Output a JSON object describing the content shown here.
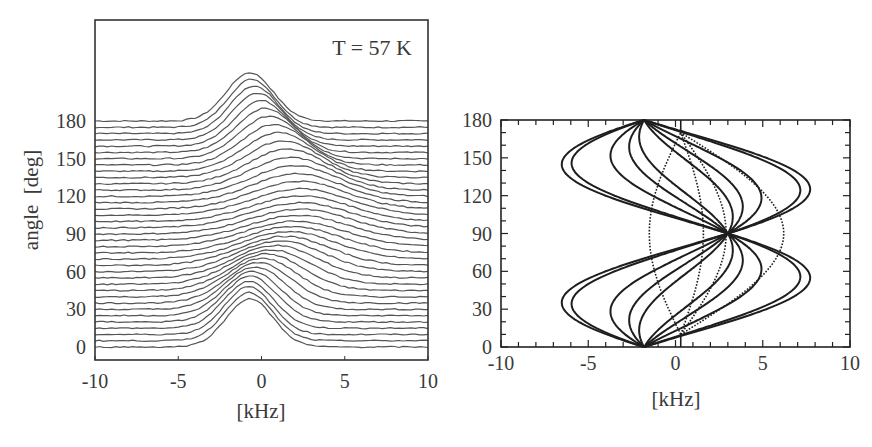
{
  "chart_data": [
    {
      "id": "left",
      "type": "line",
      "subtype": "waterfall",
      "annotation": "T = 57 K",
      "xlabel": "[kHz]",
      "ylabel": "angle  [deg]",
      "xlim": [
        -10,
        10
      ],
      "xticks": [
        -10,
        -5,
        0,
        5,
        10
      ],
      "yticks": [
        0,
        30,
        60,
        90,
        120,
        150,
        180
      ],
      "angle_step_deg": 5,
      "angles": [
        0,
        5,
        10,
        15,
        20,
        25,
        30,
        35,
        40,
        45,
        50,
        55,
        60,
        65,
        70,
        75,
        80,
        85,
        90,
        95,
        100,
        105,
        110,
        115,
        120,
        125,
        130,
        135,
        140,
        145,
        150,
        155,
        160,
        165,
        170,
        175,
        180
      ],
      "peak_model": {
        "center_khz": "0.8 - 1.5*cos(2θ) - 0.5*sin(2θ)",
        "width_sigma_khz": "1.4 + 1.6*sin²θ",
        "height_deg_units": "36 + 34*cos²θ"
      },
      "line_color": "#555555",
      "grid": false
    },
    {
      "id": "right",
      "type": "line",
      "subtype": "angular-dependence",
      "xlabel": "[kHz]",
      "ylabel": "",
      "xlim": [
        -10,
        10
      ],
      "ylim": [
        0,
        180
      ],
      "xticks": [
        -10,
        -5,
        0,
        5,
        10
      ],
      "yticks": [
        0,
        30,
        60,
        90,
        120,
        150,
        180
      ],
      "solid_model": "ν(θ) = 0.6 - 2.4*cos(2θ) + C*sin(2θ)",
      "solid_C": [
        6.7,
        6.1,
        -6.7,
        -6.1,
        3.6,
        -3.6,
        2.2,
        -2.2,
        1.2,
        -1.2
      ],
      "dotted_model": "ν(θ) = 0.3 + D*sin(π(θ-10)/160), θ∈[10,170]",
      "dotted_D": [
        -1.8,
        5.9,
        1.3,
        2.6
      ],
      "crossing_points": [
        {
          "x": -1.8,
          "y": 0
        },
        {
          "x": -1.8,
          "y": 180
        },
        {
          "x": 3.0,
          "y": 90
        }
      ],
      "line_color": "#1e1e1e",
      "grid": false
    }
  ]
}
